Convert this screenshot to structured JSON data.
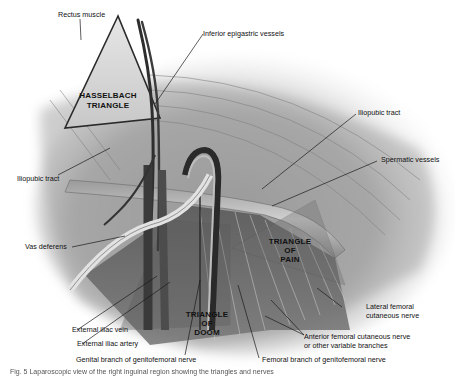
{
  "figure": {
    "regions": [
      {
        "id": "hasselbach",
        "lines": [
          "HASSELBACH",
          "TRIANGLE"
        ]
      },
      {
        "id": "pain",
        "lines": [
          "TRIANGLE",
          "OF",
          "PAIN"
        ]
      },
      {
        "id": "doom",
        "lines": [
          "TRIANGLE",
          "OF",
          "DOOM"
        ]
      }
    ],
    "labels": {
      "rectus_muscle": "Rectus muscle",
      "inferior_epigastric": "Inferior epigastric vessels",
      "iliopubic_tract_right": "Iliopubic tract",
      "iliopubic_tract_left": "Iliopubic tract",
      "spermatic_vessels": "Spermatic vessels",
      "vas_deferens": "Vas deferens",
      "lateral_femoral_1": "Lateral femoral",
      "lateral_femoral_2": "cutaneous nerve",
      "external_iliac_vein": "External iliac vein",
      "external_iliac_artery": "External iliac artery",
      "anterior_femoral_1": "Anterior femoral cutaneous nerve",
      "anterior_femoral_2": "or other variable branches",
      "genital_branch": "Genital branch of genitofemoral nerve",
      "femoral_branch": "Femoral branch of genitofemoral nerve"
    },
    "caption": "Fig. 5 Laparoscopic view of the right inguinal region showing the triangles and nerves"
  },
  "colors": {
    "background": "#ffffff",
    "label_text": "#111111",
    "leader_line": "#1a1a1a",
    "tissue_light": "#d9d9d9",
    "tissue_mid": "#9a9a9a",
    "tissue_dark": "#4a4a4a"
  }
}
